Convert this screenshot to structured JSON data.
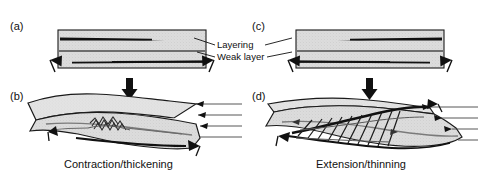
{
  "figure": {
    "width": 484,
    "height": 179,
    "background": "#ffffff"
  },
  "colors": {
    "block_fill": "#dcdcdc",
    "block_fill_light": "#e6e6e6",
    "outline": "#1a1a1a",
    "layer_dark": "#111111",
    "weak_layer": "#6e6e6e",
    "reference_line": "#555555",
    "text": "#111111"
  },
  "panels": [
    {
      "id": "a",
      "letter": "(a)",
      "role": "contraction-initial-cross-section",
      "arrow_direction": "inward",
      "description": "Undeformed layered block, cross section, arrows point inward"
    },
    {
      "id": "b",
      "letter": "(b)",
      "role": "contraction-deformed-block",
      "caption": "Contraction/thickening",
      "arrow_direction": "inward",
      "description": "Three-dimensional block showing folded and thickened layers above weak layer"
    },
    {
      "id": "c",
      "letter": "(c)",
      "role": "extension-initial-cross-section",
      "arrow_direction": "outward",
      "description": "Undeformed layered block, cross section, arrows point outward"
    },
    {
      "id": "d",
      "letter": "(d)",
      "role": "extension-deformed-block",
      "caption": "Extension/thinning",
      "arrow_direction": "outward",
      "description": "Three-dimensional block showing normal faults and thinned layers above weak layer"
    }
  ],
  "annotations": {
    "layering": "Layering",
    "weak_layer": "Weak layer"
  },
  "captions": {
    "left": "Contraction/thickening",
    "right": "Extension/thinning"
  },
  "icons": {
    "down_arrow": "down-arrow-icon",
    "convergence_arrow": "convergence-arrow-icon",
    "divergence_arrow": "divergence-arrow-icon"
  }
}
